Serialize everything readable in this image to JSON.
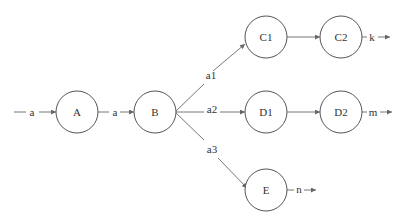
{
  "diagram": {
    "type": "state-flow",
    "nodes": [
      {
        "id": "A",
        "label": "A",
        "cx": 77,
        "cy": 112
      },
      {
        "id": "B",
        "label": "B",
        "cx": 155,
        "cy": 112
      },
      {
        "id": "C1",
        "label": "C1",
        "cx": 266,
        "cy": 37
      },
      {
        "id": "C2",
        "label": "C2",
        "cx": 341,
        "cy": 37
      },
      {
        "id": "D1",
        "label": "D1",
        "cx": 266,
        "cy": 112
      },
      {
        "id": "D2",
        "label": "D2",
        "cx": 341,
        "cy": 112
      },
      {
        "id": "E",
        "label": "E",
        "cx": 266,
        "cy": 190
      }
    ],
    "edges": [
      {
        "from": "input",
        "to": "A",
        "label": "a"
      },
      {
        "from": "A",
        "to": "B",
        "label": "a"
      },
      {
        "from": "B",
        "to": "C1",
        "label": "a1"
      },
      {
        "from": "B",
        "to": "D1",
        "label": "a2"
      },
      {
        "from": "B",
        "to": "E",
        "label": "a3"
      },
      {
        "from": "C1",
        "to": "C2",
        "label": ""
      },
      {
        "from": "D1",
        "to": "D2",
        "label": ""
      },
      {
        "from": "C2",
        "to": "output",
        "label": "k"
      },
      {
        "from": "D2",
        "to": "output",
        "label": "m"
      },
      {
        "from": "E",
        "to": "output",
        "label": "n"
      }
    ],
    "labels": {
      "in_a": "a",
      "ab_a": "a",
      "a1": "a1",
      "a2": "a2",
      "a3": "a3",
      "k": "k",
      "m": "m",
      "n": "n"
    },
    "colors": {
      "stroke": "#555555",
      "edge": "#777777",
      "text": "#333333",
      "background": "#ffffff"
    }
  }
}
